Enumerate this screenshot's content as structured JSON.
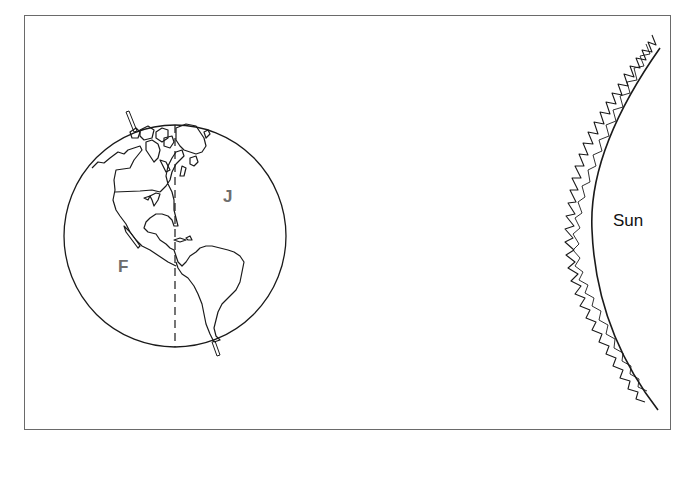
{
  "diagram": {
    "type": "earth-sun-illustration",
    "colors": {
      "stroke": "#1a1a1a",
      "frame": "#6a6a6a",
      "label_gray": "#6e6e6e",
      "background": "#ffffff"
    },
    "earth": {
      "region_labels": {
        "west": "F",
        "east": "J"
      },
      "features": [
        "tilted-axis",
        "dashed-meridian",
        "north-america",
        "south-america"
      ]
    },
    "sun": {
      "label": "Sun"
    }
  }
}
